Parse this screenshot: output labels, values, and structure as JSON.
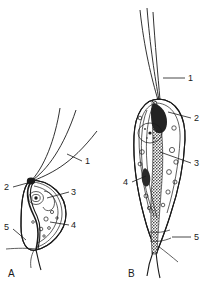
{
  "figure": {
    "kind": "scientific-line-drawing",
    "background_color": "#ffffff",
    "ink_color": "#1a1a1a"
  },
  "panels": [
    {
      "id": "A",
      "label": "A",
      "label_x": 8,
      "label_y": 277,
      "flagella_count": 3,
      "callouts": [
        {
          "number": "1",
          "x": 85,
          "y": 164,
          "leader_from": [
            82,
            161
          ],
          "leader_to": [
            67,
            154
          ]
        },
        {
          "number": "2",
          "x": 5,
          "y": 190,
          "leader_from": [
            13,
            187
          ],
          "leader_to": [
            31,
            182
          ]
        },
        {
          "number": "3",
          "x": 72,
          "y": 195,
          "leader_from": [
            69,
            192
          ],
          "leader_to": [
            47,
            198
          ]
        },
        {
          "number": "4",
          "x": 72,
          "y": 228,
          "leader_from": [
            69,
            225
          ],
          "leader_to": [
            50,
            222
          ]
        },
        {
          "number": "5",
          "x": 5,
          "y": 230,
          "leader_from": [
            13,
            229
          ],
          "leader_to": [
            26,
            238
          ]
        }
      ]
    },
    {
      "id": "B",
      "label": "B",
      "label_x": 128,
      "label_y": 277,
      "flagella_count": 3,
      "callouts": [
        {
          "number": "1",
          "x": 188,
          "y": 81,
          "leader_from": [
            185,
            78
          ],
          "leader_to": [
            163,
            78
          ]
        },
        {
          "number": "2",
          "x": 194,
          "y": 121,
          "leader_from": [
            191,
            118
          ],
          "leader_to": [
            168,
            112
          ]
        },
        {
          "number": "3",
          "x": 194,
          "y": 166,
          "leader_from": [
            191,
            163
          ],
          "leader_to": [
            160,
            152
          ]
        },
        {
          "number": "4",
          "x": 125,
          "y": 185,
          "leader_from": [
            132,
            182
          ],
          "leader_to": [
            146,
            176
          ]
        },
        {
          "number": "5",
          "x": 194,
          "y": 240,
          "leader_from": [
            191,
            237
          ],
          "leader_to": [
            172,
            237
          ]
        }
      ]
    }
  ],
  "legend_numbers": [
    "1",
    "2",
    "3",
    "4",
    "5"
  ]
}
